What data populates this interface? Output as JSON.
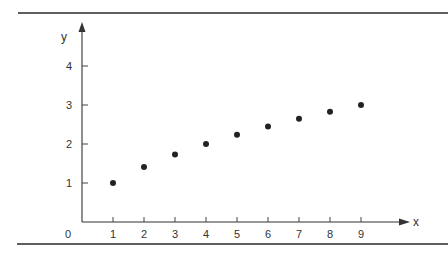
{
  "chart_data": {
    "type": "scatter",
    "title": "",
    "xlabel": "x",
    "ylabel": "y",
    "x": [
      1,
      2,
      3,
      4,
      5,
      6,
      7,
      8,
      9
    ],
    "y": [
      1.0,
      1.41,
      1.73,
      2.0,
      2.24,
      2.45,
      2.65,
      2.83,
      3.0
    ],
    "series": [
      {
        "name": "points",
        "x": [
          1,
          2,
          3,
          4,
          5,
          6,
          7,
          8,
          9
        ],
        "values": [
          1.0,
          1.41,
          1.73,
          2.0,
          2.24,
          2.45,
          2.65,
          2.83,
          3.0
        ]
      }
    ],
    "x_ticks": [
      1,
      2,
      3,
      4,
      5,
      6,
      7,
      8,
      9
    ],
    "y_ticks": [
      1,
      2,
      3,
      4
    ],
    "origin_label": "0",
    "xlim": [
      0,
      10
    ],
    "ylim": [
      0,
      5
    ],
    "grid": false,
    "legend": null,
    "axes_style": "arrowed axes from origin",
    "marker_color": "#222222"
  },
  "layout": {
    "origin_px": [
      82,
      222
    ],
    "x_unit_px": 31.0,
    "y_unit_px": 39.0,
    "x_axis_end_px": 410,
    "y_axis_end_px": 22,
    "top_rule": {
      "x1": 18,
      "x2": 448,
      "y": 13
    },
    "bottom_rule": {
      "x1": 17,
      "x2": 448,
      "y": 244
    }
  }
}
